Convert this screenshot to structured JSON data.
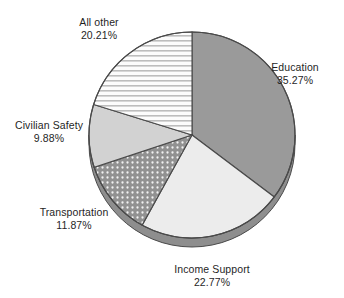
{
  "chart_data": {
    "type": "pie",
    "title": "",
    "categories": [
      "Education",
      "Income Support",
      "Transportation",
      "Civilian Safety",
      "All other"
    ],
    "values": [
      35.27,
      22.77,
      11.87,
      9.88,
      20.21
    ],
    "unit": "%",
    "start_angle_deg": 0,
    "direction": "clockwise",
    "legend": "none",
    "labels_position": "outside",
    "slices": [
      {
        "name": "Education",
        "value": 35.27,
        "label": "Education",
        "value_label": "35.27%",
        "fill": "#9a9a9a",
        "pattern": "solid"
      },
      {
        "name": "Income Support",
        "value": 22.77,
        "label": "Income Support",
        "value_label": "22.77%",
        "fill": "#ececec",
        "pattern": "solid"
      },
      {
        "name": "Transportation",
        "value": 11.87,
        "label": "Transportation",
        "value_label": "11.87%",
        "fill": "#919191",
        "pattern": "dots"
      },
      {
        "name": "Civilian Safety",
        "value": 9.88,
        "label": "Civilian Safety",
        "value_label": "9.88%",
        "fill": "#d2d2d2",
        "pattern": "solid"
      },
      {
        "name": "All other",
        "value": 20.21,
        "label": "All other",
        "value_label": "20.21%",
        "fill": "#fbfbfb",
        "pattern": "horizontal-stripes"
      }
    ],
    "style": {
      "background": "#ffffff",
      "outline": "#4a4a4a",
      "depth_shadow": "#8a8a8a",
      "three_d": true
    }
  }
}
